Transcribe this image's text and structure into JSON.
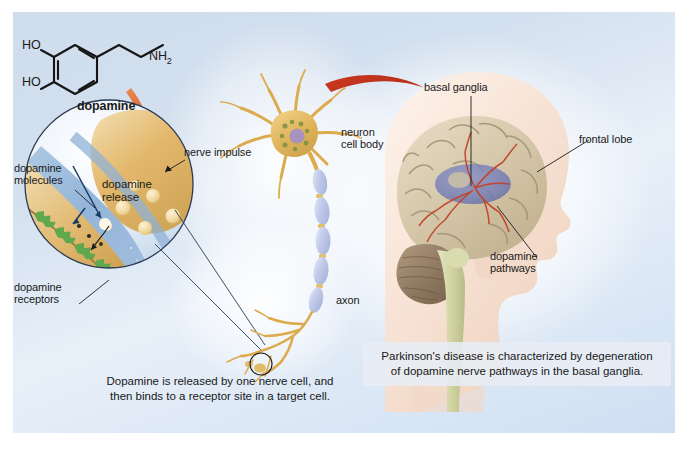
{
  "figure": {
    "background_color": "#ffffff",
    "panel_color": "#d7e3f2"
  },
  "molecule": {
    "name_label": "dopamine",
    "atoms": {
      "ho_top": "HO",
      "ho_bottom": "HO",
      "amine": "NH",
      "amine_subscript": "2"
    }
  },
  "synapse_inset": {
    "labels": {
      "dopamine_molecules": "dopamine\nmolecules",
      "dopamine_release": "dopamine\nrelease",
      "dopamine_receptors": "dopamine\nreceptors",
      "nerve_impulse": "nerve impulse"
    },
    "colors": {
      "terminal": "#e0b468",
      "cleft": "#8fb4d8",
      "receptor": "#5fa84e",
      "vesicle": "#f2d79b"
    }
  },
  "neuron": {
    "labels": {
      "cell_body": "neuron\ncell body",
      "axon": "axon"
    },
    "colors": {
      "soma": "#e3b75c",
      "myelin": "#c2cce8",
      "nucleus": "#9b86c4"
    }
  },
  "brain": {
    "labels": {
      "basal_ganglia": "basal ganglia",
      "frontal_lobe": "frontal lobe",
      "dopamine_pathways": "dopamine\npathways"
    },
    "colors": {
      "cortex": "#d9cdb4",
      "basal_ganglia": "#7b83bc",
      "pathways": "#c0432a",
      "skin": "#f5e2d6",
      "brainstem": "#d9dcae"
    }
  },
  "captions": {
    "synapse": "Dopamine is released by one nerve cell, and\nthen binds to a receptor site in a target cell.",
    "brain": "Parkinson's disease is characterized by degeneration\nof dopamine nerve pathways in the basal ganglia."
  },
  "arrows": {
    "to_synapse": "red-curved-arrow-down",
    "to_brain": "red-curved-arrow-right",
    "color": "#c4351f"
  }
}
